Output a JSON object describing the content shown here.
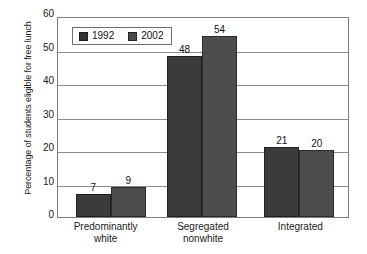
{
  "chart_data": {
    "type": "bar",
    "title": "",
    "xlabel": "",
    "ylabel": "Percentage of students eligible for free lunch",
    "ylim": [
      0,
      60
    ],
    "ytick_step": 10,
    "yticks": [
      0,
      10,
      20,
      30,
      40,
      50,
      60
    ],
    "ytick_labels": [
      "0",
      "10",
      "20",
      "30",
      "40",
      "50",
      "60"
    ],
    "grid": true,
    "grid_axis": "y",
    "legend_position": "top-left-inside",
    "categories": [
      "Predominantly\nwhite",
      "Segregated\nnonwhite",
      "Integrated"
    ],
    "category_lines": [
      [
        "Predominantly",
        "white"
      ],
      [
        "Segregated",
        "nonwhite"
      ],
      [
        "Integrated",
        ""
      ]
    ],
    "series": [
      {
        "name": "1992",
        "color": "#3b3b3b",
        "values": [
          7,
          48,
          21
        ],
        "value_labels": [
          "7",
          "48",
          "21"
        ]
      },
      {
        "name": "2002",
        "color": "#4d4d4d",
        "values": [
          9,
          54,
          20
        ],
        "value_labels": [
          "9",
          "54",
          "20"
        ]
      }
    ]
  },
  "legend": {
    "entries": [
      {
        "label": "1992"
      },
      {
        "label": "2002"
      }
    ]
  },
  "axes": {
    "y_title": "Percentage of students eligible for free lunch"
  }
}
